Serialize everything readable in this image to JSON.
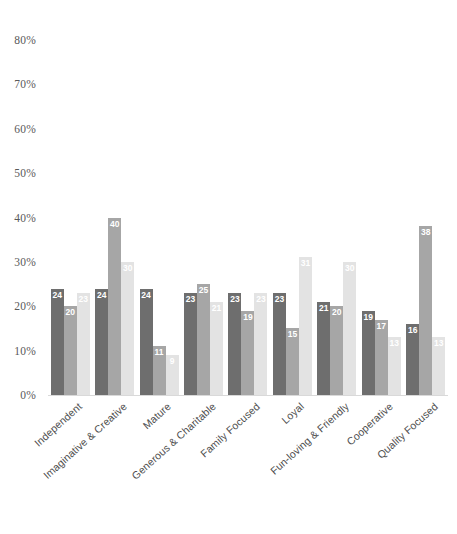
{
  "chart_data": {
    "type": "bar",
    "title": "",
    "subtitle": "",
    "xlabel": "",
    "ylabel": "",
    "ylim": [
      0,
      80
    ],
    "grid": false,
    "legend_position": "none",
    "ytick_labels": [
      "80%",
      "70%",
      "60%",
      "50%",
      "40%",
      "30%",
      "20%",
      "10%",
      "0%"
    ],
    "ytick_values": [
      80,
      70,
      60,
      50,
      40,
      30,
      20,
      10,
      0
    ],
    "categories": [
      "Independent",
      "Imaginative & Creative",
      "Mature",
      "Generous & Charitable",
      "Family Focused",
      "Loyal",
      "Fun-loving & Friendly",
      "Cooperative",
      "Quality Focused"
    ],
    "series": [
      {
        "name": "Series 1",
        "color": "#6e6e6e",
        "values": [
          24,
          24,
          24,
          23,
          23,
          23,
          21,
          19,
          16
        ]
      },
      {
        "name": "Series 2",
        "color": "#a6a6a6",
        "values": [
          20,
          40,
          11,
          25,
          19,
          15,
          20,
          17,
          38
        ]
      },
      {
        "name": "Series 3",
        "color": "#e3e3e3",
        "values": [
          23,
          30,
          9,
          21,
          23,
          31,
          30,
          13,
          13
        ]
      }
    ]
  }
}
